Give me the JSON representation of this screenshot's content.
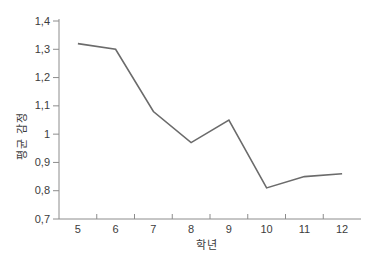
{
  "figure": {
    "background": "#ffffff"
  },
  "chart_data": {
    "type": "line",
    "title": "",
    "xlabel": "학년",
    "ylabel": "평균 감정",
    "categories": [
      "5",
      "6",
      "7",
      "8",
      "9",
      "10",
      "11",
      "12"
    ],
    "series": [
      {
        "name": "평균 감정",
        "values": [
          1.32,
          1.3,
          1.08,
          0.97,
          1.05,
          0.81,
          0.85,
          0.86
        ]
      }
    ],
    "ylim": [
      0.7,
      1.4
    ],
    "y_tick_step": 0.1,
    "y_tick_labels_top_to_bottom": [
      "1,4",
      "1,3",
      "1,2",
      "1,1",
      "1",
      "0,9",
      "0,8",
      "0,7"
    ],
    "decimal_separator": ",",
    "grid": false,
    "legend_position": "none",
    "line_color": "#6b6b6b",
    "axis_color": "#8c8c8c",
    "tick_color": "#8c8c8c",
    "text_color": "#3c3c3c"
  }
}
